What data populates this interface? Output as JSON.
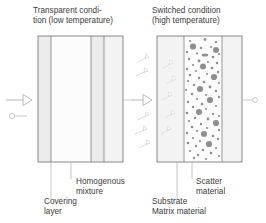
{
  "figure": {
    "type": "diagram",
    "title_left": "Transparent condi-\ntion (low temperature)",
    "title_right": "Switched condition\n(high temperature)",
    "background": "#ffffff",
    "ink": "#3a3a3a"
  },
  "panels": {
    "left": {
      "name": "transparent-state-panel",
      "caption_line1": "Transparent condi-",
      "caption_line2": "tion (low temperature)",
      "x": 38,
      "y": 36,
      "width": 85,
      "height": 126,
      "layers": [
        {
          "name": "covering-layer-left",
          "x": 38,
          "width": 13,
          "fill": "#ececec"
        },
        {
          "name": "homogenous-mixture",
          "x": 51,
          "width": 40,
          "fill": "#fbfbfb"
        },
        {
          "name": "covering-layer-right",
          "x": 91,
          "width": 13,
          "fill": "#ececec"
        },
        {
          "name": "substrate-left",
          "x": 104,
          "width": 19,
          "fill": "#f2f2f2"
        }
      ]
    },
    "right": {
      "name": "switched-state-panel",
      "caption_line1": "Switched condition",
      "caption_line2": "(high temperature)",
      "x": 157,
      "y": 36,
      "width": 85,
      "height": 126,
      "layers": [
        {
          "name": "substrate-right",
          "x": 157,
          "width": 27,
          "fill": "#f2f2f2"
        },
        {
          "name": "matrix-material",
          "x": 184,
          "width": 38,
          "fill": "#fdfdfd"
        },
        {
          "name": "covering-layer-right-panel",
          "x": 222,
          "width": 20,
          "fill": "#f2f2f2"
        }
      ],
      "scatter_particle_color": "#8c8c8c",
      "particle_count": 96
    }
  },
  "callouts": [
    {
      "name": "callout-homogenous-mixture",
      "line1": "Homogenous",
      "line2": "mixture",
      "leader_x": 71,
      "leader_top": 162,
      "leader_bottom": 178
    },
    {
      "name": "callout-covering-layer",
      "line1": "Covering",
      "line2": "layer",
      "leader_x": 51,
      "leader_top": 162,
      "leader_bottom": 198
    },
    {
      "name": "callout-scatter-material",
      "line1": "Scatter",
      "line2": "material",
      "leader_x": 192,
      "leader_top": 162,
      "leader_bottom": 178
    },
    {
      "name": "callout-substrate-matrix",
      "line1": "Substrate",
      "line2": "Matrix material",
      "leader_x": 177,
      "leader_top": 162,
      "leader_bottom": 198
    }
  ],
  "arrows": {
    "incident_left": {
      "name": "incident-light-arrow-left",
      "x": 6,
      "y": 100
    },
    "transmitted_left": {
      "name": "transmitted-light-arrow-left",
      "x": 124,
      "y": 100
    },
    "incident_right": {
      "name": "incident-light-arrow-right",
      "x": 132,
      "y": 100
    },
    "transmitted_right": {
      "name": "transmitted-light-arrow-right",
      "x": 243,
      "y": 100
    },
    "small_marker_left": {
      "name": "small-ray-marker-left",
      "x": 9,
      "y": 116
    },
    "scattered_rays_left_count": 5,
    "scattered_rays_inside_count": 5
  }
}
